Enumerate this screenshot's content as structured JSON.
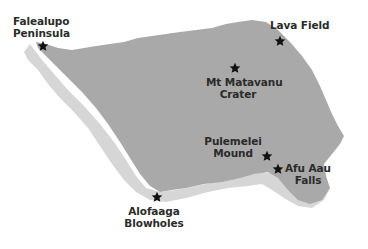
{
  "map": {
    "colors": {
      "land": "#a9a9a9",
      "coast_band": "#d6d6d6",
      "background": "#ffffff",
      "marker": "#111111",
      "label": "#2b2b2b"
    },
    "marker_icon": "star-icon",
    "places": [
      {
        "id": "falealupo",
        "line1": "Falealupo",
        "line2": "Peninsula",
        "star": [
          43,
          46
        ]
      },
      {
        "id": "lava-field",
        "line1": "Lava Field",
        "line2": "",
        "star": [
          280,
          41
        ]
      },
      {
        "id": "mt-matavanu",
        "line1": "Mt Matavanu",
        "line2": "Crater",
        "star": [
          235,
          68
        ]
      },
      {
        "id": "pulemelei",
        "line1": "Pulemelei",
        "line2": "Mound",
        "star": [
          267,
          156
        ]
      },
      {
        "id": "afu-aau",
        "line1": "Afu Aau",
        "line2": "Falls",
        "star": [
          278,
          169
        ]
      },
      {
        "id": "alofaaga",
        "line1": "Alofaaga",
        "line2": "Blowholes",
        "star": [
          157,
          197
        ]
      }
    ]
  }
}
